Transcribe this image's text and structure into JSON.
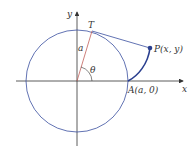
{
  "diagram": {
    "labels": {
      "y_axis": "y",
      "x_axis": "x",
      "tangent_point": "T",
      "radius": "a",
      "angle": "θ",
      "point_p": "P(x, y)",
      "point_a": "A(a, 0)"
    },
    "colors": {
      "circle": "#3a4fa0",
      "curve": "#2a3f8f",
      "axes": "#333333",
      "radius_line": "#c0605a",
      "tangent_line": "#3a4fa0"
    }
  }
}
